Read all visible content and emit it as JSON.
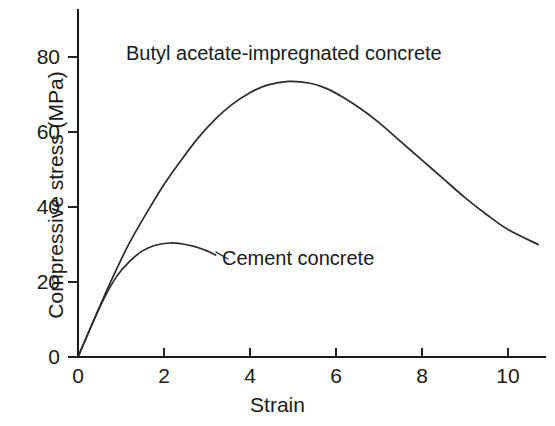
{
  "chart_data": {
    "type": "line",
    "title": "",
    "subtitle": "",
    "xlabel": "Strain",
    "ylabel": "Compressive stress (MPa)",
    "xlim": [
      0,
      10.7
    ],
    "ylim": [
      0,
      88
    ],
    "xticks": [
      0,
      2,
      4,
      6,
      8,
      10
    ],
    "xtick_labels": [
      "0",
      "2",
      "4",
      "6",
      "8",
      "10"
    ],
    "yticks": [
      0,
      20,
      40,
      60,
      80
    ],
    "ytick_labels": [
      "0",
      "20",
      "40",
      "60",
      "80"
    ],
    "grid": false,
    "legend_position": "inline-annotations",
    "line_color": "#2b2b2b",
    "axis_color": "#1a1a1a",
    "background_color": "#ffffff",
    "series": [
      {
        "name": "Butyl acetate-impregnated concrete",
        "annotation": "Butyl acetate-impregnated concrete",
        "peak": {
          "x": 4.9,
          "y": 73.5
        },
        "x": [
          0,
          0.3,
          0.6,
          0.9,
          1.2,
          1.6,
          2.0,
          2.4,
          2.8,
          3.2,
          3.6,
          4.0,
          4.4,
          4.9,
          5.4,
          5.8,
          6.2,
          6.6,
          7.0,
          7.5,
          8.0,
          8.5,
          9.0,
          9.5,
          10.0,
          10.7
        ],
        "y": [
          0,
          8.0,
          16.0,
          23.5,
          30.5,
          38.5,
          46.0,
          52.5,
          58.5,
          63.5,
          67.5,
          70.5,
          72.5,
          73.5,
          73.0,
          71.5,
          69.0,
          66.0,
          62.5,
          57.5,
          52.5,
          47.5,
          42.5,
          38.0,
          34.0,
          30.0
        ]
      },
      {
        "name": "Cement concrete",
        "annotation": "Cement concrete",
        "peak": {
          "x": 2.14,
          "y": 30.4
        },
        "x": [
          0,
          0.3,
          0.6,
          0.9,
          1.2,
          1.5,
          1.8,
          2.14,
          2.4,
          2.7,
          3.0,
          3.2
        ],
        "y": [
          0,
          8.0,
          15.5,
          21.5,
          25.5,
          28.3,
          29.8,
          30.4,
          30.2,
          29.5,
          28.3,
          27.2
        ]
      }
    ]
  }
}
